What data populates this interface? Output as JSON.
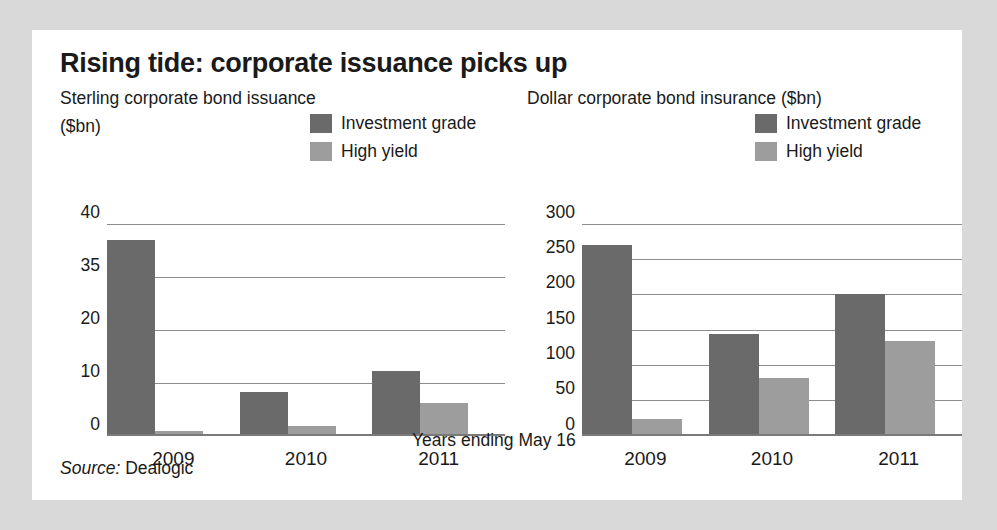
{
  "title": "Rising tide: corporate issuance picks up",
  "footnote": "Years ending May 16",
  "source_label": "Source:",
  "source_value": "Dealogic",
  "colors": {
    "investment_grade": "#6a6a6a",
    "high_yield": "#9d9d9d",
    "card_background": "#ffffff",
    "page_background": "#d9d9d9",
    "gridline": "#8d8d8d",
    "text": "#1a1a1a"
  },
  "legend": [
    {
      "label": "Investment grade",
      "swatch": "#6a6a6a"
    },
    {
      "label": "High yield",
      "swatch": "#9d9d9d"
    }
  ],
  "chart_data": [
    {
      "type": "bar",
      "id": "sterling",
      "title": "Sterling corporate bond issuance",
      "units": "($bn)",
      "xlabel": "Years ending May 16",
      "ylabel": "($bn)",
      "categories": [
        "2009",
        "2010",
        "2011"
      ],
      "yticks": [
        "40",
        "35",
        "20",
        "10",
        "0"
      ],
      "ytick_values": [
        40,
        35,
        20,
        10,
        0
      ],
      "ylim": [
        0,
        40
      ],
      "grid": true,
      "legend_position": "top-right",
      "series": [
        {
          "name": "Investment grade",
          "color": "#6a6a6a",
          "values": [
            37,
            8,
            12
          ]
        },
        {
          "name": "High yield",
          "color": "#9d9d9d",
          "values": [
            0.5,
            1.5,
            6
          ]
        }
      ]
    },
    {
      "type": "bar",
      "id": "dollar",
      "title": "Dollar corporate bond insurance ($bn)",
      "units": "($bn)",
      "xlabel": "Years ending May 16",
      "ylabel": "($bn)",
      "categories": [
        "2009",
        "2010",
        "2011"
      ],
      "yticks": [
        "300",
        "250",
        "200",
        "150",
        "100",
        "50",
        "0"
      ],
      "ytick_values": [
        300,
        250,
        200,
        150,
        100,
        50,
        0
      ],
      "ylim": [
        0,
        300
      ],
      "grid": true,
      "legend_position": "top-right",
      "series": [
        {
          "name": "Investment grade",
          "color": "#6a6a6a",
          "values": [
            270,
            143,
            200
          ]
        },
        {
          "name": "High yield",
          "color": "#9d9d9d",
          "values": [
            22,
            80,
            133
          ]
        }
      ]
    }
  ]
}
